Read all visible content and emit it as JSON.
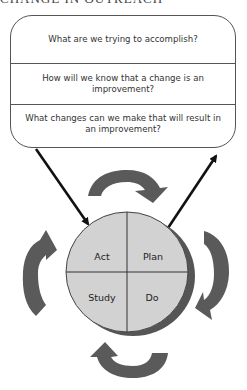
{
  "header": {
    "title_partial": "CHANGE IN OUTREACH"
  },
  "questions": [
    {
      "text": "What are we trying to accomplish?"
    },
    {
      "text": "How will we know that a change is an improvement?"
    },
    {
      "text": "What changes can we make that will result in an improvement?"
    }
  ],
  "cycle": {
    "quadrants": {
      "act": "Act",
      "plan": "Plan",
      "study": "Study",
      "do": "Do"
    }
  },
  "colors": {
    "circle_fill": "#d2d2d2",
    "circle_shadow": "#555555",
    "cycle_arrow": "#5a5a5a",
    "connector_arrow": "#111111",
    "box_border": "#555555"
  }
}
